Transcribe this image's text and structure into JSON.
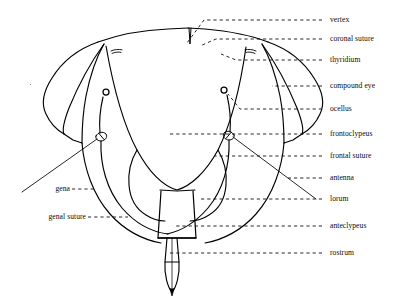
{
  "figure": {
    "line_color": "#000000",
    "leader_color": "#111111",
    "background": "#ffffff"
  },
  "labels": {
    "right": [
      {
        "id": "vertex",
        "text": "vertex",
        "x": 330,
        "y": 17,
        "leader_from_x": 322,
        "leader_to_x": 187
      },
      {
        "id": "coronal-suture",
        "text": "coronal suture",
        "x": 330,
        "y": 36,
        "leader_from_x": 322,
        "leader_to_x": 200
      },
      {
        "id": "thyridium",
        "text": "thyridium",
        "x": 330,
        "y": 57,
        "leader_from_x": 322,
        "leader_to_x": 221
      },
      {
        "id": "compound-eye",
        "text": "compound eye",
        "x": 330,
        "y": 83,
        "leader_from_x": 322,
        "leader_to_x": 272
      },
      {
        "id": "ocellus",
        "text": "ocellus",
        "x": 330,
        "y": 106,
        "leader_from_x": 322,
        "leader_to_x": 235
      },
      {
        "id": "frontoclypeus",
        "text": "frontoclypeus",
        "x": 330,
        "y": 131,
        "leader_from_x": 322,
        "leader_to_x": 170
      },
      {
        "id": "frontal-suture",
        "text": "frontal suture",
        "x": 330,
        "y": 153,
        "leader_from_x": 322,
        "leader_to_x": 215
      },
      {
        "id": "antenna",
        "text": "antenna",
        "x": 330,
        "y": 175,
        "leader_from_x": 322,
        "leader_to_x": 288
      },
      {
        "id": "lorum",
        "text": "lorum",
        "x": 330,
        "y": 197,
        "leader_from_x": 322,
        "leader_to_x": 200
      },
      {
        "id": "anteclypeus",
        "text": "anteclypeus",
        "x": 330,
        "y": 223,
        "leader_from_x": 322,
        "leader_to_x": 175
      },
      {
        "id": "rostrum",
        "text": "rostrum",
        "x": 330,
        "y": 251,
        "leader_from_x": 322,
        "leader_to_x": 170
      }
    ],
    "left": [
      {
        "id": "gena",
        "text": "gena",
        "x": 48,
        "y": 186,
        "leader_from_x": 72,
        "leader_to_x": 95
      },
      {
        "id": "genal-suture",
        "text": "genal suture",
        "x": 30,
        "y": 214,
        "leader_from_x": 88,
        "leader_to_x": 127
      }
    ]
  },
  "parts": {
    "vertex": "dorsal top plate of head",
    "coronal_suture": "median notch at top centre",
    "thyridium": "paired dark marks on vertex",
    "compound_eye": "paired lateral pointed lobes",
    "ocellus": "paired small circles",
    "frontoclypeus": "large central shield",
    "frontal_suture": "curved suture bounding frontoclypeus",
    "antenna": "thin diagonal shaft from antennal socket",
    "lorum": "crescent plate lateral to clypeus",
    "anteclypeus": "small trapezoid plate below frontoclypeus",
    "rostrum": "slender tapering beak at bottom",
    "gena": "cheek region lateral to frontoclypeus",
    "genal_suture": "suture bounding the gena"
  }
}
